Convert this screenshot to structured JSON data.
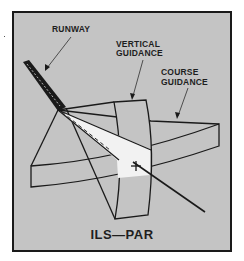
{
  "figure": {
    "title": "ILS—PAR",
    "labels": {
      "runway": "RUNWAY",
      "vertical_guidance_line1": "VERTICAL",
      "vertical_guidance_line2": "GUIDANCE",
      "course_guidance_line1": "COURSE",
      "course_guidance_line2": "GUIDANCE"
    },
    "colors": {
      "background": "#c4c4c4",
      "line": "#1a1a1a",
      "beam_fill": "#f2f2f2",
      "runway": "#1a1a1a"
    }
  }
}
